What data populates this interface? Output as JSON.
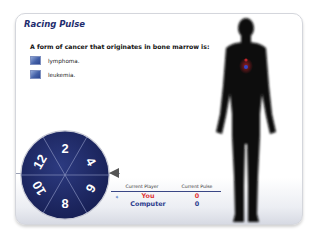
{
  "game": {
    "title": "Racing Pulse",
    "question": "A form of cancer that originates in bone marrow is:",
    "options": [
      {
        "label": "lymphoma."
      },
      {
        "label": "leukemia."
      }
    ]
  },
  "wheel": {
    "segments": [
      "2",
      "4",
      "6",
      "8",
      "10",
      "12"
    ],
    "color": "#1f2a66",
    "pointer_color": "#555555"
  },
  "scoreboard": {
    "col_player": "Current Player",
    "col_pulse": "Current Pulse",
    "current_indicator": "arrow-right-icon",
    "players": [
      {
        "name": "You",
        "pulse": "0",
        "color": "#e03434",
        "active": true
      },
      {
        "name": "Computer",
        "pulse": "0",
        "color": "#2a3a8c",
        "active": false
      }
    ]
  },
  "figure": {
    "heart_colors": [
      "#c0262a",
      "#3347c9"
    ]
  }
}
